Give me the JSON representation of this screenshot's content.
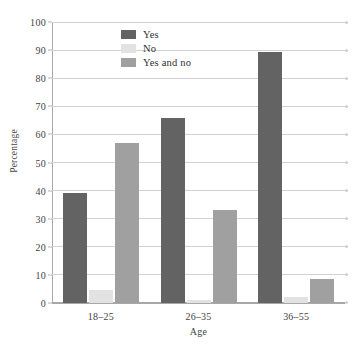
{
  "chart_data": {
    "type": "bar",
    "title": "",
    "xlabel": "Age",
    "ylabel": "Percentage",
    "categories": [
      "18–25",
      "26–35",
      "36–55"
    ],
    "series": [
      {
        "name": "Yes",
        "values": [
          39,
          66,
          89.5
        ],
        "color": "#636363"
      },
      {
        "name": "No",
        "values": [
          4.5,
          1,
          2
        ],
        "color": "#e2e2e2"
      },
      {
        "name": "Yes and no",
        "values": [
          57,
          33,
          8.5
        ],
        "color": "#a0a0a0"
      }
    ],
    "ylim": [
      0,
      100
    ],
    "yticks": [
      0,
      10,
      20,
      30,
      40,
      50,
      60,
      70,
      80,
      90,
      100
    ],
    "ytick_labels": [
      "0",
      "10",
      "20",
      "30",
      "40",
      "50",
      "60",
      "70",
      "80",
      "90",
      "100"
    ],
    "grid": true,
    "legend_position": "upper-center-left"
  },
  "legend": {
    "items": [
      {
        "label": "Yes"
      },
      {
        "label": "No"
      },
      {
        "label": "Yes and no"
      }
    ]
  }
}
